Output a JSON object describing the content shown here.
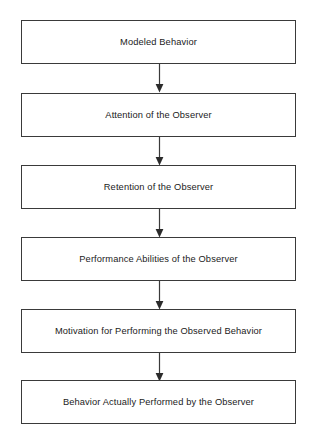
{
  "diagram": {
    "type": "flowchart",
    "orientation": "vertical-top-to-bottom",
    "background_color": "#ffffff",
    "box_border_color": "#3a3a3a",
    "text_color": "#1b1b1b",
    "arrow_color": "#3a3a3a",
    "nodes": [
      {
        "id": "modeled-behavior",
        "label": "Modeled Behavior"
      },
      {
        "id": "attention",
        "label": "Attention of the Observer"
      },
      {
        "id": "retention",
        "label": "Retention of the Observer"
      },
      {
        "id": "performance-abilities",
        "label": "Performance Abilities of the Observer"
      },
      {
        "id": "motivation",
        "label": "Motivation for Performing the Observed Behavior"
      },
      {
        "id": "behavior-performed",
        "label": "Behavior Actually Performed by the Observer"
      }
    ],
    "connectors": [
      {
        "id": "arrow-1",
        "from": "modeled-behavior",
        "to": "attention",
        "icon": "down-arrow-icon"
      },
      {
        "id": "arrow-2",
        "from": "attention",
        "to": "retention",
        "icon": "down-arrow-icon"
      },
      {
        "id": "arrow-3",
        "from": "retention",
        "to": "performance-abilities",
        "icon": "down-arrow-icon"
      },
      {
        "id": "arrow-4",
        "from": "performance-abilities",
        "to": "motivation",
        "icon": "down-arrow-icon"
      },
      {
        "id": "arrow-5",
        "from": "motivation",
        "to": "behavior-performed",
        "icon": "down-arrow-icon"
      }
    ]
  }
}
